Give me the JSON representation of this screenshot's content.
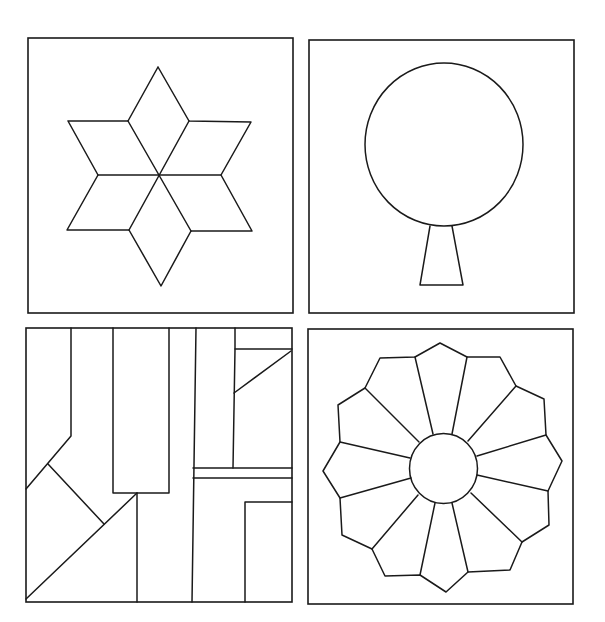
{
  "figure": {
    "stroke_color": "#1a1a1a",
    "background": "#ffffff",
    "panels": [
      {
        "id": "six-point-star",
        "frame": {
          "x": 28,
          "y": 38,
          "w": 265,
          "h": 275
        },
        "polylines": [
          [
            [
              158,
              67
            ],
            [
              189,
              121
            ],
            [
              251,
              122
            ],
            [
              221,
              175
            ],
            [
              252,
              231
            ],
            [
              191,
              231
            ],
            [
              161,
              286
            ],
            [
              129,
              230
            ],
            [
              67,
              230
            ],
            [
              98,
              175
            ],
            [
              68,
              121
            ],
            [
              128,
              121
            ],
            [
              158,
              67
            ]
          ],
          [
            [
              128,
              121
            ],
            [
              191,
              231
            ]
          ],
          [
            [
              189,
              121
            ],
            [
              129,
              230
            ]
          ],
          [
            [
              98,
              175
            ],
            [
              221,
              175
            ]
          ]
        ]
      },
      {
        "id": "tree",
        "frame": {
          "x": 309,
          "y": 40,
          "w": 265,
          "h": 273
        },
        "circle": {
          "cx": 444,
          "cy": 144.5,
          "rx": 79,
          "ry": 81.5
        },
        "polylines": [
          [
            [
              430,
              226
            ],
            [
              420,
              285
            ],
            [
              463,
              285
            ],
            [
              452,
              226
            ]
          ]
        ]
      },
      {
        "id": "abstract-strips",
        "frame": {
          "x": 26,
          "y": 328,
          "w": 266,
          "h": 274
        },
        "polylines": [
          [
            [
              71,
              328
            ],
            [
              71,
              436
            ],
            [
              26,
              489
            ]
          ],
          [
            [
              48,
              464
            ],
            [
              104,
              524
            ]
          ],
          [
            [
              26,
              599
            ],
            [
              137,
              493
            ]
          ],
          [
            [
              113,
              328
            ],
            [
              113,
              493
            ],
            [
              169,
              493
            ],
            [
              169,
              328
            ]
          ],
          [
            [
              137,
              493
            ],
            [
              137,
              602
            ]
          ],
          [
            [
              196,
              328
            ],
            [
              192,
              602
            ]
          ],
          [
            [
              235,
              328
            ],
            [
              235,
              349
            ],
            [
              233,
              468
            ]
          ],
          [
            [
              235,
              349
            ],
            [
              292,
              349
            ]
          ],
          [
            [
              234,
              393
            ],
            [
              291,
              351
            ]
          ],
          [
            [
              193,
              468
            ],
            [
              292,
              468
            ]
          ],
          [
            [
              193,
              478
            ],
            [
              292,
              478
            ]
          ],
          [
            [
              245,
              602
            ],
            [
              245,
              502
            ],
            [
              292,
              502
            ]
          ]
        ]
      },
      {
        "id": "dresden-plate",
        "frame": {
          "x": 308,
          "y": 329,
          "w": 265,
          "h": 275
        },
        "circle": {
          "cx": 443.5,
          "cy": 468.5,
          "rx": 34,
          "ry": 35
        },
        "polylines": [
          [
            [
              440,
              343
            ],
            [
              467,
              357
            ],
            [
              500,
              357
            ],
            [
              516,
              386
            ],
            [
              544,
              399
            ],
            [
              546,
              435
            ],
            [
              562,
              461
            ],
            [
              548,
              491
            ],
            [
              549,
              525
            ],
            [
              522,
              542
            ],
            [
              510,
              570
            ],
            [
              468,
              572
            ],
            [
              446,
              592
            ],
            [
              420,
              575
            ],
            [
              385,
              576
            ],
            [
              372,
              549
            ],
            [
              342,
              535
            ],
            [
              340,
              498
            ],
            [
              323,
              471
            ],
            [
              340,
              442
            ],
            [
              338,
              405
            ],
            [
              365,
              388
            ],
            [
              380,
              358
            ],
            [
              415,
              357
            ],
            [
              440,
              343
            ]
          ],
          [
            [
              415,
              357
            ],
            [
              433,
              434
            ]
          ],
          [
            [
              467,
              357
            ],
            [
              452,
              434
            ]
          ],
          [
            [
              516,
              386
            ],
            [
              468,
              441
            ]
          ],
          [
            [
              546,
              435
            ],
            [
              477,
              456
            ]
          ],
          [
            [
              548,
              491
            ],
            [
              477,
              475
            ]
          ],
          [
            [
              522,
              542
            ],
            [
              471,
              493
            ]
          ],
          [
            [
              468,
              572
            ],
            [
              452,
              503
            ]
          ],
          [
            [
              420,
              575
            ],
            [
              435,
              503
            ]
          ],
          [
            [
              372,
              549
            ],
            [
              418,
              495
            ]
          ],
          [
            [
              340,
              498
            ],
            [
              411,
              478
            ]
          ],
          [
            [
              340,
              442
            ],
            [
              410,
              458
            ]
          ],
          [
            [
              365,
              388
            ],
            [
              419,
              442
            ]
          ]
        ]
      }
    ]
  }
}
